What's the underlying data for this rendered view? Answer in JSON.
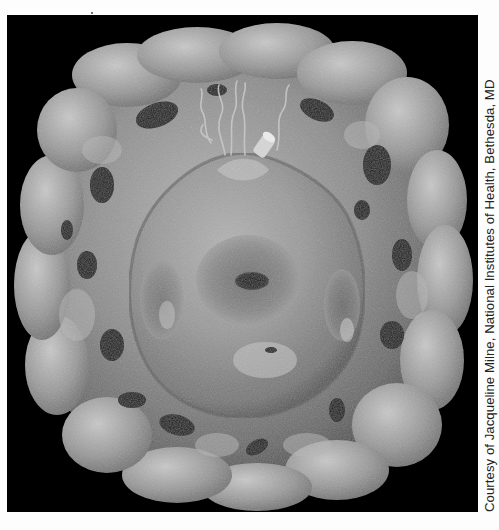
{
  "figure": {
    "background_color": "#000000",
    "shell_color": "#9a9a9a",
    "core_color": "#a8a8a8",
    "filament_color": "#c8c8c8"
  },
  "caption": {
    "credit": "Courtesy of Jacqueline Milne, National Institutes of Health, Bethesda, MD",
    "orientation": "vertical, reading bottom-to-top"
  }
}
